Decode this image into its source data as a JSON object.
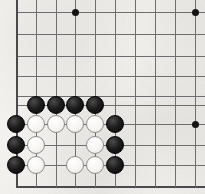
{
  "diagram": {
    "board": {
      "background_color": "#f4f2ee",
      "line_color": "#6e6e70",
      "edge_color": "#4a4a4c",
      "star_color": "#141414",
      "black_stone_color": "#141414",
      "white_stone_color": "#f7f6f3",
      "white_stone_outline": "#8d8d8f",
      "stone_diameter_px": 18,
      "spacing_x_px": 19.8,
      "spacing_y_px": 20.3,
      "origin_x_px": 16,
      "origin_y_px": 12,
      "columns": 10,
      "rows": 9,
      "corner_shown": "bottom-left"
    },
    "grid": {
      "vertical_lines_x": [
        16,
        36,
        56,
        75,
        95,
        115,
        135,
        155,
        175,
        195
      ],
      "horizontal_lines_y": [
        12,
        34,
        56,
        76,
        96,
        105,
        124,
        145,
        165,
        186
      ],
      "edge_vertical_x": 16,
      "edge_horizontal_y": 186
    },
    "star_points": [
      {
        "name": "star-point-top-left",
        "x": 75,
        "y": 12
      },
      {
        "name": "star-point-top-right",
        "x": 195,
        "y": 12
      },
      {
        "name": "star-point-right",
        "x": 195,
        "y": 124
      }
    ],
    "stones": [
      {
        "id": "b1",
        "color": "black",
        "x": 36,
        "y": 105
      },
      {
        "id": "b2",
        "color": "black",
        "x": 56,
        "y": 105
      },
      {
        "id": "b3",
        "color": "black",
        "x": 75,
        "y": 105
      },
      {
        "id": "b4",
        "color": "black",
        "x": 95,
        "y": 105
      },
      {
        "id": "b5",
        "color": "black",
        "x": 16,
        "y": 124
      },
      {
        "id": "w1",
        "color": "white",
        "x": 36,
        "y": 124
      },
      {
        "id": "w2",
        "color": "white",
        "x": 56,
        "y": 124
      },
      {
        "id": "w3",
        "color": "white",
        "x": 75,
        "y": 124
      },
      {
        "id": "w4",
        "color": "white",
        "x": 95,
        "y": 124
      },
      {
        "id": "b6",
        "color": "black",
        "x": 115,
        "y": 124
      },
      {
        "id": "b7",
        "color": "black",
        "x": 16,
        "y": 145
      },
      {
        "id": "w5",
        "color": "white",
        "x": 36,
        "y": 145
      },
      {
        "id": "w6",
        "color": "white",
        "x": 95,
        "y": 145
      },
      {
        "id": "b8",
        "color": "black",
        "x": 115,
        "y": 145
      },
      {
        "id": "b9",
        "color": "black",
        "x": 16,
        "y": 165
      },
      {
        "id": "w7",
        "color": "white",
        "x": 36,
        "y": 165
      },
      {
        "id": "w8",
        "color": "white",
        "x": 75,
        "y": 165
      },
      {
        "id": "w9",
        "color": "white",
        "x": 95,
        "y": 165
      },
      {
        "id": "b10",
        "color": "black",
        "x": 115,
        "y": 165
      }
    ],
    "empty_points_inside_group": [
      {
        "name": "eye-upper",
        "x": 56,
        "y": 145
      },
      {
        "name": "eye-lower-left",
        "x": 75,
        "y": 145
      },
      {
        "name": "eye-lower",
        "x": 56,
        "y": 165
      }
    ],
    "counts": {
      "black_stones": 10,
      "white_stones": 9,
      "star_points": 3
    }
  }
}
